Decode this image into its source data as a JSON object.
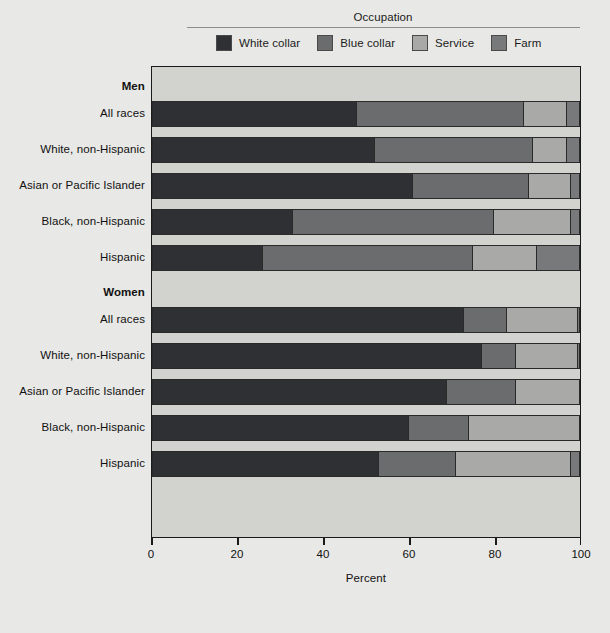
{
  "legend": {
    "title": "Occupation",
    "items": [
      {
        "label": "White collar",
        "color": "#2f3033",
        "icon": "legend-swatch-white-collar"
      },
      {
        "label": "Blue collar",
        "color": "#6a6c6e",
        "icon": "legend-swatch-blue-collar"
      },
      {
        "label": "Service",
        "color": "#a9aaa8",
        "icon": "legend-swatch-service"
      },
      {
        "label": "Farm",
        "color": "#77797a",
        "icon": "legend-swatch-farm"
      }
    ]
  },
  "axis": {
    "x_title": "Percent",
    "ticks": [
      "0",
      "20",
      "40",
      "60",
      "80",
      "100"
    ],
    "tick_values": [
      0,
      20,
      40,
      60,
      80,
      100
    ],
    "xlim": [
      0,
      100
    ]
  },
  "groups": [
    {
      "label": "Men"
    },
    {
      "label": "Women"
    }
  ],
  "chart_data": {
    "type": "bar",
    "orientation": "horizontal",
    "stacked": true,
    "title": "",
    "subtitle": "",
    "xlabel": "Percent",
    "ylabel": "",
    "xlim": [
      0,
      100
    ],
    "grid": false,
    "legend_title": "Occupation",
    "legend_position": "top",
    "series": [
      {
        "name": "White collar",
        "color": "#2f3033"
      },
      {
        "name": "Blue collar",
        "color": "#6a6c6e"
      },
      {
        "name": "Service",
        "color": "#a9aaa8"
      },
      {
        "name": "Farm",
        "color": "#77797a"
      }
    ],
    "groups": [
      {
        "name": "Men",
        "rows": [
          {
            "category": "All races",
            "values": [
              48,
              39,
              10,
              3
            ]
          },
          {
            "category": "White, non-Hispanic",
            "values": [
              52,
              37,
              8,
              3
            ]
          },
          {
            "category": "Asian or Pacific Islander",
            "values": [
              61,
              27,
              10,
              2
            ]
          },
          {
            "category": "Black, non-Hispanic",
            "values": [
              33,
              47,
              18,
              2
            ]
          },
          {
            "category": "Hispanic",
            "values": [
              26,
              49,
              15,
              10
            ]
          }
        ]
      },
      {
        "name": "Women",
        "rows": [
          {
            "category": "All races",
            "values": [
              73,
              10,
              16.5,
              0.5
            ]
          },
          {
            "category": "White, non-Hispanic",
            "values": [
              77,
              8,
              14.5,
              0.5
            ]
          },
          {
            "category": "Asian or Pacific Islander",
            "values": [
              69,
              16,
              15,
              0
            ]
          },
          {
            "category": "Black, non-Hispanic",
            "values": [
              60,
              14,
              26,
              0
            ]
          },
          {
            "category": "Hispanic",
            "values": [
              53,
              18,
              27,
              2
            ]
          }
        ]
      }
    ]
  },
  "layout": {
    "plot_bg": "#d2d2cf",
    "page_bg": "#e8e8e6",
    "frame_color": "#1a1a1a"
  }
}
